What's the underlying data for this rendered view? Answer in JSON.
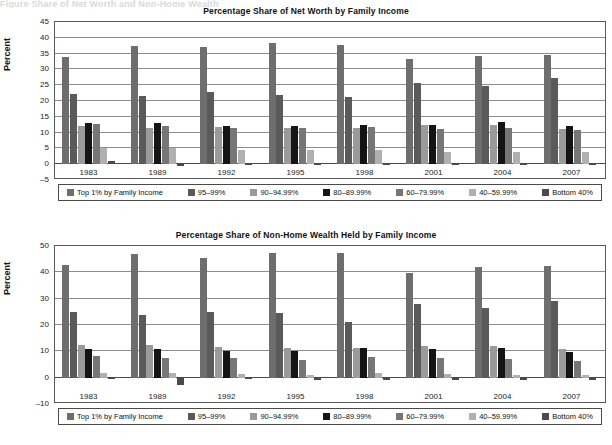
{
  "top_caption_fragment": "Figure      Share of Net Worth and Non-Home Wealth",
  "axis": {
    "ylabel": "Percent"
  },
  "legend": {
    "items": [
      {
        "label": "Top 1% by Family Income",
        "color": "#6e6e6e"
      },
      {
        "label": "95–99%",
        "color": "#5a5a5a"
      },
      {
        "label": "90–94.99%",
        "color": "#9a9a9a"
      },
      {
        "label": "80–89.99%",
        "color": "#141414"
      },
      {
        "label": "60–79.99%",
        "color": "#767676"
      },
      {
        "label": "40–59.99%",
        "color": "#b0b0b0"
      },
      {
        "label": "Bottom 40%",
        "color": "#4a4a4a"
      }
    ]
  },
  "chart_data": [
    {
      "type": "bar",
      "title": "Percentage Share of Net Worth by Family Income",
      "xlabel": "",
      "ylabel": "Percent",
      "ylim": [
        -5,
        45
      ],
      "yticks": [
        45,
        40,
        35,
        30,
        25,
        20,
        15,
        10,
        5,
        0,
        -5
      ],
      "grid": true,
      "legend_position": "bottom",
      "categories": [
        "1983",
        "1989",
        "1992",
        "1995",
        "1998",
        "2001",
        "2004",
        "2007"
      ],
      "series": [
        {
          "name": "Top 1% by Family Income",
          "color": "#6e6e6e",
          "values": [
            33.8,
            37.4,
            37.0,
            38.5,
            37.8,
            33.4,
            34.3,
            34.6
          ]
        },
        {
          "name": "95–99%",
          "color": "#5a5a5a",
          "values": [
            22.3,
            21.6,
            22.8,
            21.8,
            21.3,
            25.8,
            24.6,
            27.3
          ]
        },
        {
          "name": "90–94.99%",
          "color": "#9a9a9a",
          "values": [
            12.1,
            11.6,
            11.8,
            11.5,
            11.5,
            12.3,
            12.3,
            11.2
          ]
        },
        {
          "name": "80–89.99%",
          "color": "#141414",
          "values": [
            13.1,
            13.0,
            12.0,
            12.0,
            12.5,
            12.5,
            13.4,
            12.0
          ]
        },
        {
          "name": "60–79.99%",
          "color": "#767676",
          "values": [
            12.6,
            12.1,
            11.5,
            11.4,
            11.9,
            11.0,
            11.3,
            10.9
          ]
        },
        {
          "name": "40–59.99%",
          "color": "#b0b0b0",
          "values": [
            5.2,
            5.1,
            4.5,
            4.5,
            4.5,
            3.9,
            3.8,
            4.0
          ]
        },
        {
          "name": "Bottom 40%",
          "color": "#4a4a4a",
          "values": [
            0.9,
            -0.7,
            0.2,
            0.2,
            0.2,
            -0.2,
            0.2,
            0.2
          ]
        }
      ]
    },
    {
      "type": "bar",
      "title": "Percentage Share of Non-Home Wealth Held by Family Income",
      "xlabel": "",
      "ylabel": "Percent",
      "ylim": [
        -10,
        50
      ],
      "yticks": [
        50,
        40,
        30,
        20,
        10,
        0,
        -10
      ],
      "grid": true,
      "legend_position": "bottom",
      "categories": [
        "1983",
        "1989",
        "1992",
        "1995",
        "1998",
        "2001",
        "2004",
        "2007"
      ],
      "series": [
        {
          "name": "Top 1% by Family Income",
          "color": "#6e6e6e",
          "values": [
            42.9,
            46.9,
            45.6,
            47.2,
            47.3,
            39.7,
            42.2,
            42.4
          ]
        },
        {
          "name": "95–99%",
          "color": "#5a5a5a",
          "values": [
            25.1,
            23.9,
            25.0,
            24.6,
            21.0,
            27.8,
            26.5,
            29.2
          ]
        },
        {
          "name": "90–94.99%",
          "color": "#9a9a9a",
          "values": [
            12.3,
            12.4,
            11.5,
            11.2,
            11.2,
            12.1,
            11.9,
            10.7
          ]
        },
        {
          "name": "80–89.99%",
          "color": "#141414",
          "values": [
            11.0,
            11.0,
            10.0,
            10.0,
            11.2,
            11.0,
            11.3,
            9.7
          ]
        },
        {
          "name": "60–79.99%",
          "color": "#767676",
          "values": [
            8.1,
            7.6,
            7.3,
            6.8,
            8.0,
            7.6,
            7.1,
            6.5
          ]
        },
        {
          "name": "40–59.99%",
          "color": "#b0b0b0",
          "values": [
            1.7,
            1.6,
            1.4,
            1.2,
            1.6,
            1.4,
            1.0,
            1.2
          ]
        },
        {
          "name": "Bottom 40%",
          "color": "#4a4a4a",
          "values": [
            -0.6,
            -2.6,
            -0.7,
            -1.0,
            -0.8,
            -0.9,
            -0.8,
            -0.9
          ]
        }
      ]
    }
  ]
}
